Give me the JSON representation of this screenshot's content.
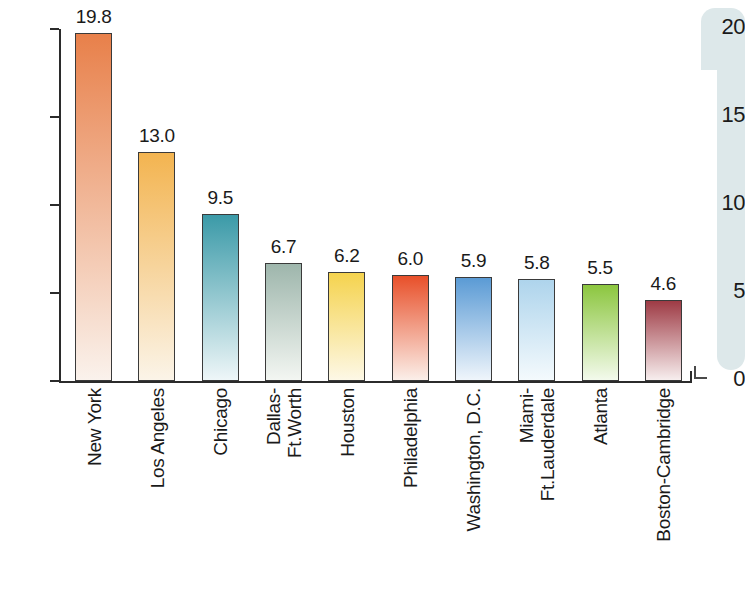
{
  "chart_data": {
    "type": "bar",
    "title": "",
    "subtitle": "",
    "xlabel": "",
    "ylabel": "",
    "ylim": [
      0,
      20
    ],
    "yticks": [
      "0",
      "5",
      "10",
      "15",
      "20"
    ],
    "ytick_values": [
      0,
      5,
      10,
      15,
      20
    ],
    "grid": false,
    "legend": "none",
    "categories": [
      "New York",
      "Los Angeles",
      "Chicago",
      "Dallas-Ft.Worth",
      "Houston",
      "Philadelphia",
      "Washington, D.C.",
      "Miami-Ft.Lauderdale",
      "Atlanta",
      "Boston-Cambridge"
    ],
    "values": [
      19.8,
      13.0,
      9.5,
      6.7,
      6.2,
      6.0,
      5.9,
      5.8,
      5.5,
      4.6
    ],
    "value_labels": [
      "19.8",
      "13.0",
      "9.5",
      "6.7",
      "6.2",
      "6.0",
      "5.9",
      "5.8",
      "5.5",
      "4.6"
    ],
    "bars": [
      {
        "category": "New York",
        "label_line1": "New York",
        "label_line2": "",
        "value": 19.8,
        "value_label": "19.8",
        "color_top": "#e8804a",
        "color_bottom": "#faf2ec"
      },
      {
        "category": "Los Angeles",
        "label_line1": "Los Angeles",
        "label_line2": "",
        "value": 13.0,
        "value_label": "13.0",
        "color_top": "#f3b450",
        "color_bottom": "#fbf4e8"
      },
      {
        "category": "Chicago",
        "label_line1": "Chicago",
        "label_line2": "",
        "value": 9.5,
        "value_label": "9.5",
        "color_top": "#3b9aa8",
        "color_bottom": "#eef6f8"
      },
      {
        "category": "Dallas-Ft.Worth",
        "label_line1": "Dallas-",
        "label_line2": "Ft.Worth",
        "value": 6.7,
        "value_label": "6.7",
        "color_top": "#9eb6ac",
        "color_bottom": "#f3f6f2"
      },
      {
        "category": "Houston",
        "label_line1": "Houston",
        "label_line2": "",
        "value": 6.2,
        "value_label": "6.2",
        "color_top": "#f5d34e",
        "color_bottom": "#fdf8e6"
      },
      {
        "category": "Philadelphia",
        "label_line1": "Philadelphia",
        "label_line2": "",
        "value": 6.0,
        "value_label": "6.0",
        "color_top": "#e8502a",
        "color_bottom": "#fbefe9"
      },
      {
        "category": "Washington, D.C.",
        "label_line1": "Washington, D.C.",
        "label_line2": "",
        "value": 5.9,
        "value_label": "5.9",
        "color_top": "#5b9bd5",
        "color_bottom": "#eff5fb"
      },
      {
        "category": "Miami-Ft.Lauderdale",
        "label_line1": "Miami-",
        "label_line2": "Ft.Lauderdale",
        "value": 5.8,
        "value_label": "5.8",
        "color_top": "#aed4ec",
        "color_bottom": "#f4fafd"
      },
      {
        "category": "Atlanta",
        "label_line1": "Atlanta",
        "label_line2": "",
        "value": 5.5,
        "value_label": "5.5",
        "color_top": "#8cc63f",
        "color_bottom": "#f3faec"
      },
      {
        "category": "Boston-Cambridge",
        "label_line1": "Boston-Cambridge",
        "label_line2": "",
        "value": 4.6,
        "value_label": "4.6",
        "color_top": "#9e3b45",
        "color_bottom": "#f7eeee"
      }
    ]
  },
  "decoration": {
    "shape_color": "#dde8ea",
    "shape_name": "pale-mint-rounded-bracket"
  },
  "axis": {
    "line_color": "#2b2b2b",
    "label_color": "#1a1a1a"
  }
}
